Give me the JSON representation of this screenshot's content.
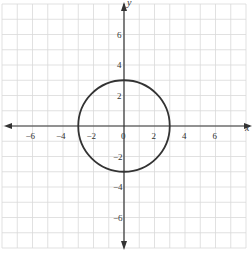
{
  "chart_data": {
    "type": "line",
    "title": "",
    "subtitle": "",
    "xlabel": "x",
    "ylabel": "y",
    "xlim": [
      -8,
      8
    ],
    "ylim": [
      -8,
      8
    ],
    "grid": true,
    "grid_step": 1,
    "legend": null,
    "x_ticks": [
      -6,
      -4,
      -2,
      0,
      2,
      4,
      6
    ],
    "x_tick_labels": [
      "−6",
      "−4",
      "−2",
      "0",
      "2",
      "4",
      "6"
    ],
    "y_ticks": [
      -6,
      -4,
      -2,
      2,
      4,
      6
    ],
    "y_tick_labels": [
      "−6",
      "−4",
      "−2",
      "2",
      "4",
      "6"
    ],
    "series": [
      {
        "name": "circle",
        "shape": "circle",
        "equation": "x^2 + y^2 = 9",
        "center": [
          0,
          0
        ],
        "radius": 3,
        "color": "#333333"
      }
    ],
    "colors": {
      "grid": "#d9d9d9",
      "axis": "#333333",
      "curve": "#333333",
      "background": "#ffffff"
    }
  }
}
